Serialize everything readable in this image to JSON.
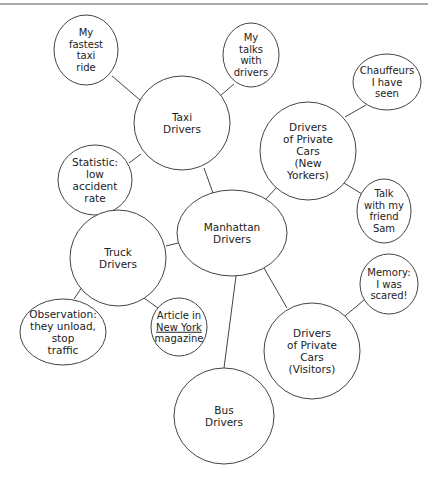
{
  "diagram": {
    "stroke_color": "#444444",
    "background": "#ffffff",
    "top_rule": {
      "x1": 0,
      "y1": 4,
      "x2": 428,
      "y2": 4
    },
    "nodes": [
      {
        "id": "manhattan",
        "lines": [
          "Manhattan",
          "Drivers"
        ],
        "cx": 232,
        "cy": 233,
        "rx": 55,
        "ry": 43
      },
      {
        "id": "taxi",
        "lines": [
          "Taxi",
          "Drivers"
        ],
        "cx": 182,
        "cy": 123,
        "rx": 48,
        "ry": 47
      },
      {
        "id": "fastest-ride",
        "lines": [
          "My",
          "fastest",
          "taxi",
          "ride"
        ],
        "cx": 86,
        "cy": 50,
        "rx": 32,
        "ry": 35
      },
      {
        "id": "talks-drivers",
        "lines": [
          "My",
          "talks",
          "with",
          "drivers"
        ],
        "cx": 251,
        "cy": 55,
        "rx": 28,
        "ry": 32
      },
      {
        "id": "statistic",
        "lines": [
          "Statistic:",
          "low",
          "accident",
          "rate"
        ],
        "cx": 95,
        "cy": 180,
        "rx": 37,
        "ry": 35
      },
      {
        "id": "private-ny",
        "lines": [
          "Drivers",
          "of Private",
          "Cars",
          "(New",
          "Yorkers)"
        ],
        "cx": 308,
        "cy": 151,
        "rx": 48,
        "ry": 49
      },
      {
        "id": "chauffeurs",
        "lines": [
          "Chauffeurs",
          "I have",
          "seen"
        ],
        "cx": 387,
        "cy": 82,
        "rx": 34,
        "ry": 28
      },
      {
        "id": "friend-sam",
        "lines": [
          "Talk",
          "with my",
          "friend",
          "Sam"
        ],
        "cx": 384,
        "cy": 211,
        "rx": 27,
        "ry": 32
      },
      {
        "id": "truck",
        "lines": [
          "Truck",
          "Drivers"
        ],
        "cx": 118,
        "cy": 258,
        "rx": 48,
        "ry": 48
      },
      {
        "id": "observation",
        "lines": [
          "Observation:",
          "they unload,",
          "stop",
          "traffic"
        ],
        "cx": 63,
        "cy": 332,
        "rx": 43,
        "ry": 33
      },
      {
        "id": "article",
        "lines": [
          "Article in",
          "New York",
          "magazine"
        ],
        "underline_line": 1,
        "cx": 179,
        "cy": 327,
        "rx": 28,
        "ry": 29
      },
      {
        "id": "private-visitors",
        "lines": [
          "Drivers",
          "of Private",
          "Cars",
          "(Visitors)"
        ],
        "cx": 312,
        "cy": 351,
        "rx": 48,
        "ry": 48
      },
      {
        "id": "memory",
        "lines": [
          "Memory:",
          "I was",
          "scared!"
        ],
        "cx": 389,
        "cy": 284,
        "rx": 29,
        "ry": 30
      },
      {
        "id": "bus",
        "lines": [
          "Bus",
          "Drivers"
        ],
        "cx": 224,
        "cy": 416,
        "rx": 50,
        "ry": 48
      }
    ],
    "edges": [
      {
        "from": "manhattan",
        "to": "taxi",
        "x1": 213,
        "y1": 193,
        "x2": 204,
        "y2": 168
      },
      {
        "from": "manhattan",
        "to": "private-ny",
        "x1": 266,
        "y1": 199,
        "x2": 277,
        "y2": 187
      },
      {
        "from": "manhattan",
        "to": "truck",
        "x1": 178,
        "y1": 243,
        "x2": 166,
        "y2": 246
      },
      {
        "from": "manhattan",
        "to": "private-visitors",
        "x1": 264,
        "y1": 268,
        "x2": 287,
        "y2": 308
      },
      {
        "from": "manhattan",
        "to": "bus",
        "x1": 236,
        "y1": 276,
        "x2": 224,
        "y2": 368
      },
      {
        "from": "taxi",
        "to": "fastest-ride",
        "x1": 140,
        "y1": 100,
        "x2": 112,
        "y2": 76
      },
      {
        "from": "taxi",
        "to": "talks-drivers",
        "x1": 220,
        "y1": 96,
        "x2": 234,
        "y2": 84
      },
      {
        "from": "taxi",
        "to": "statistic",
        "x1": 141,
        "y1": 154,
        "x2": 129,
        "y2": 163
      },
      {
        "from": "private-ny",
        "to": "chauffeurs",
        "x1": 345,
        "y1": 117,
        "x2": 366,
        "y2": 105
      },
      {
        "from": "private-ny",
        "to": "friend-sam",
        "x1": 344,
        "y1": 183,
        "x2": 362,
        "y2": 194
      },
      {
        "from": "truck",
        "to": "observation",
        "x1": 82,
        "y1": 287,
        "x2": 74,
        "y2": 299
      },
      {
        "from": "truck",
        "to": "article",
        "x1": 144,
        "y1": 298,
        "x2": 158,
        "y2": 308
      },
      {
        "from": "private-visitors",
        "to": "memory",
        "x1": 345,
        "y1": 316,
        "x2": 364,
        "y2": 300
      }
    ]
  }
}
